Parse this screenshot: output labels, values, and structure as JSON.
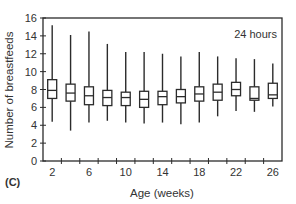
{
  "chart_data": {
    "type": "box",
    "title": "",
    "annotation": "24 hours",
    "panel_label": "(C)",
    "xlabel": "Age (weeks)",
    "ylabel": "Number of breastfeeds",
    "ylim": [
      0,
      16
    ],
    "yticks": [
      0,
      2,
      4,
      6,
      8,
      10,
      12,
      14,
      16
    ],
    "xtick_labels": [
      "2",
      "6",
      "10",
      "14",
      "18",
      "22",
      "26"
    ],
    "grid": false,
    "legend": null,
    "categories": [
      2,
      4,
      6,
      8,
      10,
      12,
      14,
      16,
      18,
      20,
      22,
      24,
      26
    ],
    "boxes": [
      {
        "x": 2,
        "whisker_high": 15.2,
        "q3": 9.1,
        "median": 7.9,
        "q1": 7.0,
        "whisker_low": 4.4
      },
      {
        "x": 4,
        "whisker_high": 14.1,
        "q3": 8.6,
        "median": 7.6,
        "q1": 6.7,
        "whisker_low": 3.4
      },
      {
        "x": 6,
        "whisker_high": 14.5,
        "q3": 8.3,
        "median": 7.3,
        "q1": 6.3,
        "whisker_low": 4.3
      },
      {
        "x": 8,
        "whisker_high": 13.1,
        "q3": 7.9,
        "median": 7.1,
        "q1": 6.2,
        "whisker_low": 4.5
      },
      {
        "x": 10,
        "whisker_high": 12.2,
        "q3": 7.7,
        "median": 7.1,
        "q1": 6.2,
        "whisker_low": 4.3
      },
      {
        "x": 12,
        "whisker_high": 12.2,
        "q3": 7.8,
        "median": 6.9,
        "q1": 6.0,
        "whisker_low": 4.2
      },
      {
        "x": 14,
        "whisker_high": 12.0,
        "q3": 7.8,
        "median": 7.2,
        "q1": 6.3,
        "whisker_low": 4.3
      },
      {
        "x": 16,
        "whisker_high": 11.7,
        "q3": 8.0,
        "median": 7.2,
        "q1": 6.5,
        "whisker_low": 4.1
      },
      {
        "x": 18,
        "whisker_high": 12.2,
        "q3": 8.3,
        "median": 7.5,
        "q1": 6.7,
        "whisker_low": 4.3
      },
      {
        "x": 20,
        "whisker_high": 11.7,
        "q3": 8.6,
        "median": 7.7,
        "q1": 6.8,
        "whisker_low": 5.0
      },
      {
        "x": 22,
        "whisker_high": 11.5,
        "q3": 8.8,
        "median": 8.0,
        "q1": 7.3,
        "whisker_low": 5.6
      },
      {
        "x": 24,
        "whisker_high": 11.4,
        "q3": 8.3,
        "median": 7.0,
        "q1": 6.8,
        "whisker_low": 5.5
      },
      {
        "x": 26,
        "whisker_high": 10.9,
        "q3": 8.7,
        "median": 7.4,
        "q1": 7.0,
        "whisker_low": 6.1
      }
    ]
  },
  "style": {
    "line_color": "#2b2b2b",
    "background": "#ffffff"
  }
}
